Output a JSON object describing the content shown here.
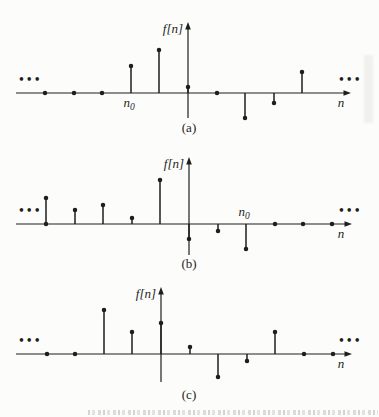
{
  "page": {
    "background": "#fcfcfa",
    "ink": "#1e1e1c"
  },
  "figure": {
    "ylabel": "f[n]",
    "xlabel": "n",
    "n0_label": {
      "base": "n",
      "sub": "0"
    },
    "ellipsis": "•••",
    "panel_labels": [
      "(a)",
      "(b)",
      "(c)"
    ]
  },
  "chart_data": [
    {
      "type": "stem",
      "panel": "(a)",
      "ylabel": "f[n]",
      "xlabel": "n",
      "x": [
        -5,
        -4,
        -3,
        -2,
        -1,
        0,
        1,
        2,
        3,
        4
      ],
      "values": [
        0,
        0,
        0,
        27,
        43,
        6,
        0,
        -25,
        -10,
        21
      ],
      "n0": {
        "index": -2,
        "position": "below"
      },
      "base_dots": [],
      "left_ellipsis": true,
      "right_ellipsis": true,
      "layout": {
        "origin_x": 188,
        "axis_y": 93,
        "axis_top": 22,
        "axis_bottom": 118,
        "x_start": 16,
        "x_end": 351,
        "spacing": 28.6,
        "label_y": 132
      }
    },
    {
      "type": "stem",
      "panel": "(b)",
      "ylabel": "f[n]",
      "xlabel": "n",
      "x": [
        -5,
        -4,
        -3,
        -2,
        -1,
        0,
        1,
        2,
        3,
        4,
        5
      ],
      "values": [
        26,
        14,
        19,
        6,
        44,
        -15,
        -7,
        -25,
        0,
        0,
        0
      ],
      "n0": {
        "index": 2,
        "position": "above"
      },
      "base_dots": [
        -5
      ],
      "left_ellipsis": true,
      "right_ellipsis": true,
      "layout": {
        "origin_x": 189,
        "axis_y": 224,
        "axis_top": 157,
        "axis_bottom": 255,
        "x_start": 16,
        "x_end": 352,
        "spacing": 28.6,
        "label_y": 268
      }
    },
    {
      "type": "stem",
      "panel": "(c)",
      "ylabel": "f[n]",
      "xlabel": "n",
      "x": [
        -4,
        -3,
        -2,
        -1,
        0,
        1,
        2,
        3,
        4,
        5,
        6
      ],
      "values": [
        0,
        0,
        44,
        22,
        31,
        7,
        -23,
        -7,
        22,
        0,
        0
      ],
      "n0": null,
      "base_dots": [],
      "left_ellipsis": true,
      "right_ellipsis": true,
      "layout": {
        "origin_x": 161,
        "axis_y": 354,
        "axis_top": 287,
        "axis_bottom": 382,
        "x_start": 16,
        "x_end": 352,
        "spacing": 28.6,
        "label_y": 399
      }
    }
  ]
}
